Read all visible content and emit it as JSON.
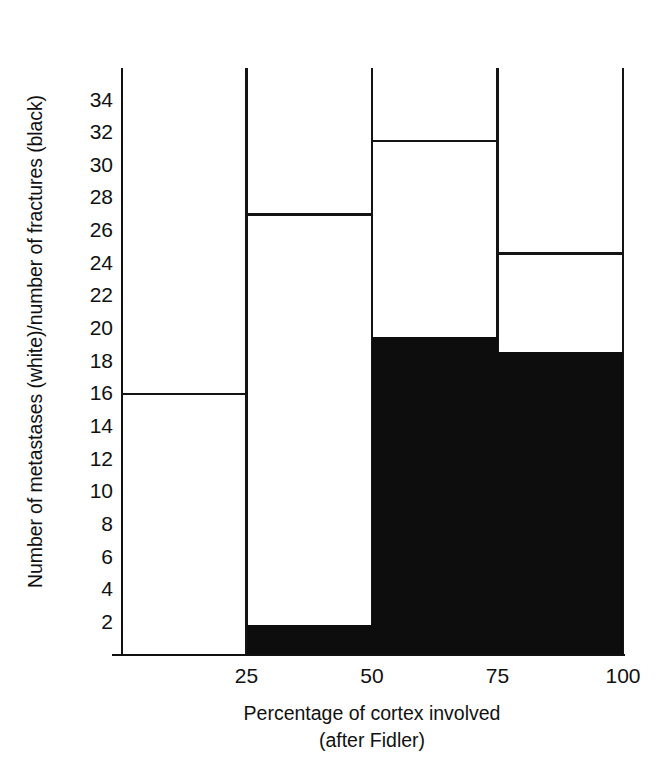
{
  "chart_data": {
    "type": "bar",
    "title": "",
    "subtitle": "",
    "ylabel": "Number of metastases (white)/number of fractures (black)",
    "xlabel": "Percentage of cortex involved",
    "xlabel_sub": "(after Fidler)",
    "xtick_labels": [
      "25",
      "50",
      "75",
      "100"
    ],
    "ytick_labels": [
      "34",
      "32",
      "30",
      "28",
      "26",
      "24",
      "22",
      "20",
      "18",
      "16",
      "14",
      "12",
      "10",
      "8",
      "6",
      "4",
      "2"
    ],
    "ylim": [
      0,
      35.9
    ],
    "xlim": [
      0,
      100
    ],
    "grid": false,
    "legend": "none",
    "categories": [
      "0-25",
      "25-50",
      "50-75",
      "75-100"
    ],
    "bin_edges": [
      0,
      25,
      50,
      75,
      100
    ],
    "series": [
      {
        "name": "Number of metastases (white)",
        "color": "#ffffff",
        "outline": "#141414",
        "values": [
          16,
          27,
          31.5,
          24.6
        ]
      },
      {
        "name": "Number of fractures (black)",
        "color": "#0d0d0d",
        "outline": "#0d0d0d",
        "values": [
          0,
          1.8,
          19.4,
          18.5
        ]
      }
    ],
    "colors": {
      "metastases": "#ffffff",
      "fractures": "#0d0d0d",
      "axis": "#111111"
    }
  }
}
